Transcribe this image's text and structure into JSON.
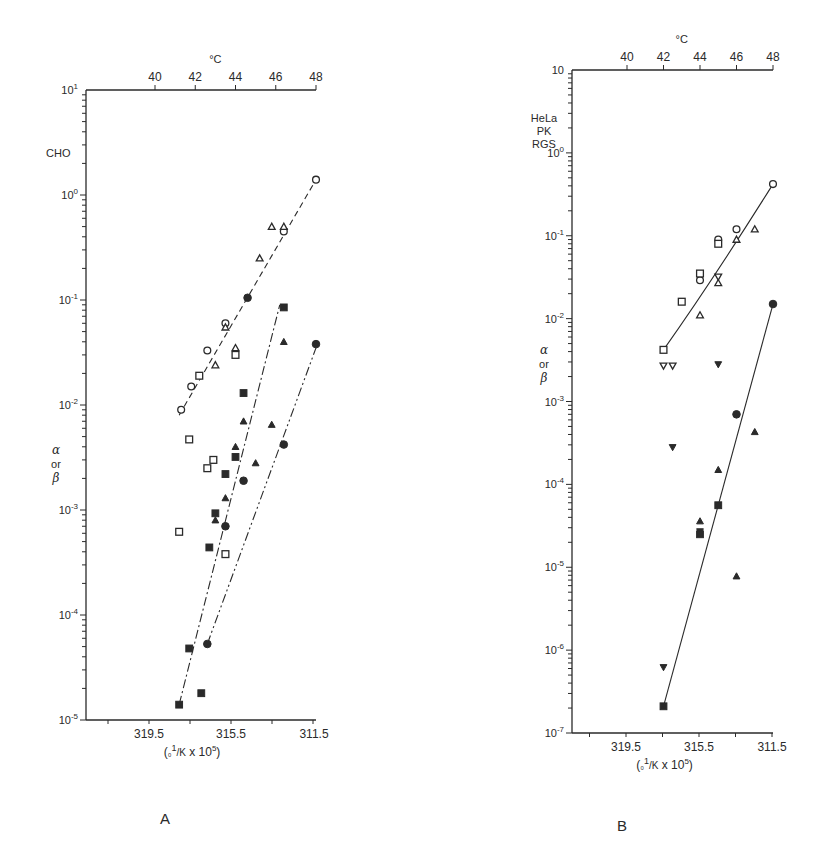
{
  "figure": {
    "panels": [
      {
        "id": "A",
        "panel_label": "A",
        "cell_label": "CHO",
        "y_label_lines": [
          "α",
          "or",
          "β"
        ],
        "top_axis_unit": "°C",
        "bottom_axis_label": "(₀1/K x 10⁵)"
      },
      {
        "id": "B",
        "panel_label": "B",
        "cell_label_lines": [
          "HeLa",
          "PK",
          "RGS"
        ],
        "y_label_lines": [
          "α",
          "or",
          "β"
        ],
        "top_axis_unit": "°C",
        "bottom_axis_label": "(₀1/K x 10⁵)"
      }
    ]
  },
  "chart_data": [
    {
      "type": "scatter",
      "title": "A",
      "subtitle": "CHO",
      "xlabel": "(1/K x 10^5)",
      "ylabel": "α or β",
      "x_top_label": "°C",
      "x_top_ticks": [
        40,
        42,
        44,
        46,
        48
      ],
      "x_bottom_ticks": [
        319.5,
        315.5,
        311.5
      ],
      "y_scale": "log",
      "ylim": [
        1e-05,
        10
      ],
      "y_ticks": [
        "10^1",
        "10^0",
        "10^-1",
        "10^-2",
        "10^-3",
        "10^-4",
        "10^-5"
      ],
      "temperature_range_C": [
        40,
        48
      ],
      "series": [
        {
          "name": "open circle",
          "marker": "open-circle",
          "points": [
            [
              41.3,
              0.009
            ],
            [
              41.8,
              0.015
            ],
            [
              42.6,
              0.033
            ],
            [
              43.5,
              0.06
            ],
            [
              46.4,
              0.45
            ],
            [
              48.0,
              1.4
            ]
          ]
        },
        {
          "name": "open square",
          "marker": "open-square",
          "points": [
            [
              41.2,
              0.00062
            ],
            [
              41.7,
              0.0047
            ],
            [
              42.2,
              0.019
            ],
            [
              42.6,
              0.0025
            ],
            [
              42.9,
              0.003
            ],
            [
              43.5,
              0.00038
            ],
            [
              44.0,
              0.03
            ]
          ]
        },
        {
          "name": "open triangle",
          "marker": "open-triangle",
          "points": [
            [
              43.0,
              0.024
            ],
            [
              43.5,
              0.055
            ],
            [
              44.0,
              0.035
            ],
            [
              45.2,
              0.25
            ],
            [
              45.8,
              0.5
            ],
            [
              46.4,
              0.5
            ]
          ]
        },
        {
          "name": "filled square",
          "marker": "filled-square",
          "points": [
            [
              41.2,
              1.4e-05
            ],
            [
              41.7,
              4.8e-05
            ],
            [
              42.3,
              1.8e-05
            ],
            [
              42.7,
              0.00044
            ],
            [
              43.0,
              0.00093
            ],
            [
              43.5,
              0.0022
            ],
            [
              44.0,
              0.0032
            ],
            [
              44.4,
              0.013
            ],
            [
              46.4,
              0.085
            ]
          ]
        },
        {
          "name": "filled triangle",
          "marker": "filled-triangle",
          "points": [
            [
              43.0,
              0.0008
            ],
            [
              43.5,
              0.0013
            ],
            [
              44.0,
              0.004
            ],
            [
              44.4,
              0.007
            ],
            [
              45.0,
              0.0028
            ],
            [
              45.8,
              0.0065
            ],
            [
              46.4,
              0.04
            ]
          ]
        },
        {
          "name": "filled circle",
          "marker": "filled-circle",
          "points": [
            [
              42.6,
              5.3e-05
            ],
            [
              43.5,
              0.0007
            ],
            [
              44.4,
              0.0019
            ],
            [
              44.6,
              0.105
            ],
            [
              46.4,
              0.0042
            ],
            [
              48.0,
              0.038
            ]
          ]
        }
      ],
      "fit_lines": [
        {
          "style": "dashed",
          "from": [
            41.2,
            0.008
          ],
          "to": [
            48.0,
            1.4
          ]
        },
        {
          "style": "dash-dot",
          "from": [
            41.2,
            1.4e-05
          ],
          "to": [
            46.2,
            0.09
          ]
        },
        {
          "style": "dash-dot-dot",
          "from": [
            42.6,
            5.3e-05
          ],
          "to": [
            48.0,
            0.035
          ]
        }
      ]
    },
    {
      "type": "scatter",
      "title": "B",
      "subtitle": "HeLa PK RGS",
      "xlabel": "(1/K x 10^5)",
      "ylabel": "α or β",
      "x_top_label": "°C",
      "x_top_ticks": [
        40,
        42,
        44,
        46,
        48
      ],
      "x_bottom_ticks": [
        319.5,
        315.5,
        311.5
      ],
      "y_scale": "log",
      "ylim": [
        1e-07,
        10
      ],
      "y_ticks": [
        "10",
        "10^-1",
        "10^-2",
        "10^-3",
        "10^-4",
        "10^-5",
        "10^-6",
        "10^-7"
      ],
      "temperature_range_C": [
        40,
        48
      ],
      "series": [
        {
          "name": "open circle",
          "marker": "open-circle",
          "points": [
            [
              44.0,
              0.029
            ],
            [
              45.0,
              0.09
            ],
            [
              46.0,
              0.12
            ],
            [
              48.0,
              0.42
            ]
          ]
        },
        {
          "name": "open square",
          "marker": "open-square",
          "points": [
            [
              42.0,
              0.0042
            ],
            [
              43.0,
              0.016
            ],
            [
              44.0,
              0.035
            ],
            [
              45.0,
              0.08
            ]
          ]
        },
        {
          "name": "open triangle",
          "marker": "open-triangle",
          "points": [
            [
              44.0,
              0.011
            ],
            [
              45.0,
              0.027
            ],
            [
              46.0,
              0.09
            ],
            [
              47.0,
              0.12
            ]
          ]
        },
        {
          "name": "open inverted triangle",
          "marker": "open-inv-triangle",
          "points": [
            [
              42.0,
              0.0027
            ],
            [
              42.5,
              0.0027
            ],
            [
              45.0,
              0.032
            ]
          ]
        },
        {
          "name": "filled inverted triangle",
          "marker": "filled-inv-triangle",
          "points": [
            [
              42.0,
              6.2e-07
            ],
            [
              42.5,
              0.00028
            ],
            [
              44.0,
              2.7e-05
            ],
            [
              45.0,
              0.0028
            ]
          ]
        },
        {
          "name": "filled square",
          "marker": "filled-square",
          "points": [
            [
              42.0,
              2.1e-07
            ],
            [
              44.0,
              2.5e-05
            ],
            [
              45.0,
              5.6e-05
            ]
          ]
        },
        {
          "name": "filled triangle",
          "marker": "filled-triangle",
          "points": [
            [
              44.0,
              3.6e-05
            ],
            [
              45.0,
              0.00015
            ],
            [
              46.0,
              7.8e-06
            ],
            [
              47.0,
              0.00043
            ]
          ]
        },
        {
          "name": "filled circle",
          "marker": "filled-circle",
          "points": [
            [
              46.0,
              0.0007
            ],
            [
              48.0,
              0.015
            ]
          ]
        }
      ],
      "fit_lines": [
        {
          "style": "solid",
          "curve": "open symbols",
          "from": [
            42.0,
            0.0042
          ],
          "to": [
            48.0,
            0.42
          ]
        },
        {
          "style": "solid",
          "curve": "filled symbols",
          "from": [
            42.0,
            2.1e-07
          ],
          "to": [
            48.0,
            0.015
          ]
        }
      ]
    }
  ]
}
